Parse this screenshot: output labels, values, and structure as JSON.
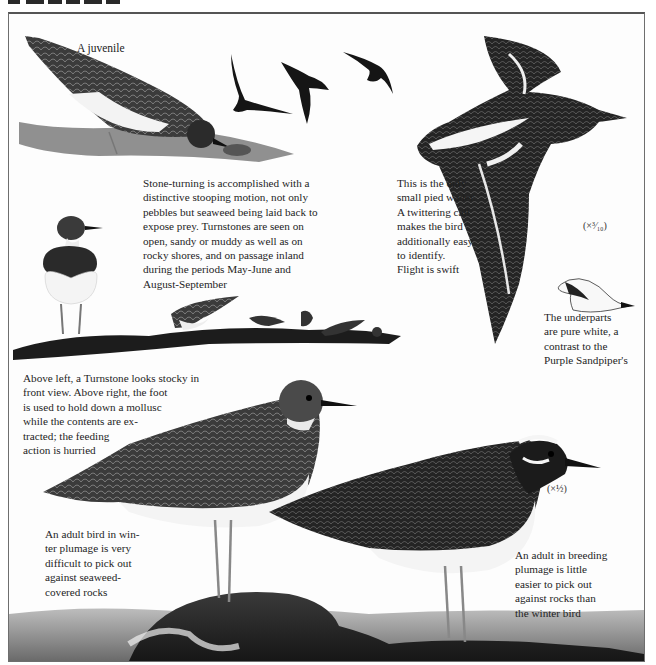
{
  "page": {
    "type": "field-guide illustration plate",
    "subject": "Turnstone",
    "header_text_visible": false
  },
  "labels": {
    "juvenile": "A juvenile",
    "scale_flight": "(×³⁄₁₀)",
    "scale_adults": "(×½)"
  },
  "captions": {
    "stone_turning": "Stone-turning is accomplished with a\ndistinctive stooping motion, not only\npebbles but seaweed being laid back to\nexpose prey. Turnstones are seen on\nopen, sandy or muddy as well as on\nrocky shores, and on passage inland\nduring the periods May-June and\nAugust-September",
    "pied_wader": "This is the only\nsmall pied wader.\nA twittering call\nmakes the bird\nadditionally easy\nto identify.\nFlight is swift",
    "underparts": "The underparts\nare pure white, a\ncontrast to the\nPurple Sandpiper's",
    "front_view": "Above left, a Turnstone looks stocky in\nfront view. Above right, the foot\nis used to hold down a mollusc\nwhile the contents are ex-\ntracted; the feeding\naction is hurried",
    "winter_adult": "An adult bird in win-\nter plumage is very\ndifficult to pick out\nagainst seaweed-\ncovered rocks",
    "breeding_adult": "An adult in breeding\nplumage is little\neasier to pick out\nagainst rocks than\nthe winter bird"
  },
  "illustrations": [
    {
      "id": "juvenile-feeding",
      "description": "Juvenile Turnstone feeding on mollusc on rock"
    },
    {
      "id": "flock-flying",
      "description": "Three Turnstones in flight"
    },
    {
      "id": "flight-topview",
      "description": "Large Turnstone in flight, upper side"
    },
    {
      "id": "front-view",
      "description": "Turnstone standing, front view"
    },
    {
      "id": "feeding-group",
      "description": "Group of small Turnstones feeding on shoreline"
    },
    {
      "id": "flight-underside",
      "description": "Small Turnstone in flight showing white underparts"
    },
    {
      "id": "winter-adult",
      "description": "Adult Turnstone in winter plumage on rock"
    },
    {
      "id": "breeding-adult",
      "description": "Adult Turnstone in breeding plumage on rock"
    }
  ],
  "colors": {
    "ink": "#1e1e1e",
    "frame": "#6e6e6e",
    "paper": "#fdfdfd"
  }
}
